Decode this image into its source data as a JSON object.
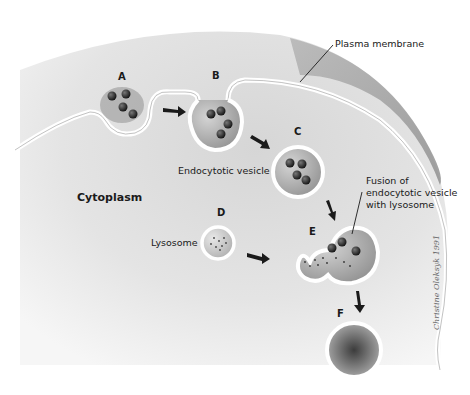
{
  "diagram": {
    "regions": {
      "cytoplasm": "Cytoplasm"
    },
    "stages": [
      {
        "id": "A",
        "label": "A",
        "description": "Invagination of plasma membrane around particles"
      },
      {
        "id": "B",
        "label": "B",
        "description": "Pinching vesicle"
      },
      {
        "id": "C",
        "label": "C",
        "description": "Endocytotic vesicle"
      },
      {
        "id": "D",
        "label": "D",
        "description": "Lysosome"
      },
      {
        "id": "E",
        "label": "E",
        "description": "Fusion of endocytotic vesicle with lysosome"
      },
      {
        "id": "F",
        "label": "F",
        "description": "Digested contents"
      }
    ],
    "annotations": {
      "plasma_membrane": "Plasma membrane",
      "endocytotic_vesicle": "Endocytotic vesicle",
      "lysosome": "Lysosome",
      "fusion_line1": "Fusion of",
      "fusion_line2": "endocytotic vesicle",
      "fusion_line3": "with lysosome"
    },
    "signature": "Christine Oleksyk 1991",
    "colors": {
      "cytoplasm": "#d9d9d9",
      "extracellular_shade": "#a8a8a8",
      "membrane": "#ffffff",
      "particle": "#1e1e1e",
      "vesicle_interior": "#b5b5b5"
    }
  }
}
